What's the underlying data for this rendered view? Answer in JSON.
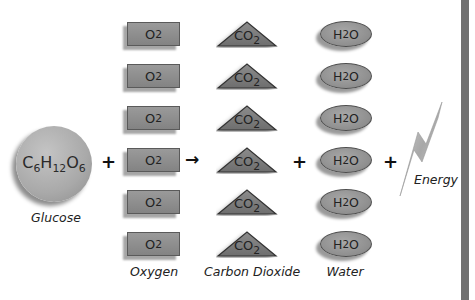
{
  "equation": {
    "reactant_glucose": {
      "formula_parts": [
        "C",
        "6",
        "H",
        "12",
        "O",
        "6"
      ],
      "label": "Glucose"
    },
    "operators": {
      "plus_1": "+",
      "arrow": "→",
      "plus_2": "+",
      "plus_3": "+"
    },
    "oxygen": {
      "formula": "O",
      "subscript": "2",
      "count": 6,
      "label": "Oxygen"
    },
    "carbon_dioxide": {
      "formula": "CO",
      "subscript": "2",
      "count": 6,
      "label": "Carbon Dioxide"
    },
    "water": {
      "formula_h": "H",
      "subscript": "2",
      "formula_o": "O",
      "count": 6,
      "label": "Water"
    },
    "energy": {
      "label": "Energy"
    }
  },
  "colors": {
    "molecule_fill": "#949494",
    "molecule_border": "#5a5a5a",
    "side_bar": "#707070",
    "text": "#222222"
  }
}
